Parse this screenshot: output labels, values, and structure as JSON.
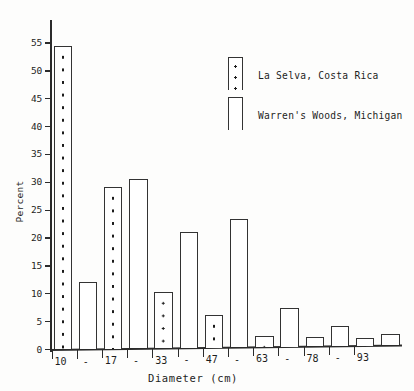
{
  "chart_data": {
    "type": "bar",
    "title": "",
    "xlabel": "Diameter (cm)",
    "ylabel": "Percent",
    "ylim": [
      0,
      57
    ],
    "ytick_values": [
      0,
      5,
      10,
      15,
      20,
      25,
      30,
      35,
      40,
      45,
      50,
      55
    ],
    "ytick_labels": [
      "0",
      "5",
      "10",
      "15",
      "20",
      "25",
      "30",
      "35",
      "40",
      "45",
      "50",
      "55"
    ],
    "xtick_labels": [
      "10",
      "-",
      "17",
      "-",
      "33",
      "-",
      "47",
      "-",
      "63",
      "-",
      "78",
      "-",
      "93"
    ],
    "categories": [
      "10-17",
      "17-33",
      "33-47",
      "47-63",
      "63-78",
      "78-93",
      "93+"
    ],
    "grid": false,
    "legend_position": "upper right",
    "series": [
      {
        "name": "La Selva, Costa Rica",
        "fill": "dotted",
        "values": [
          54.5,
          29.0,
          10.0,
          5.8,
          2.0,
          1.6,
          1.4
        ]
      },
      {
        "name": "Warren's Woods, Michigan",
        "fill": "white",
        "values": [
          12.0,
          30.5,
          20.8,
          23.0,
          7.0,
          3.5,
          2.0
        ]
      }
    ]
  },
  "legend": {
    "entries": [
      {
        "label": "La Selva, Costa Rica"
      },
      {
        "label": "Warren's Woods, Michigan"
      }
    ]
  }
}
